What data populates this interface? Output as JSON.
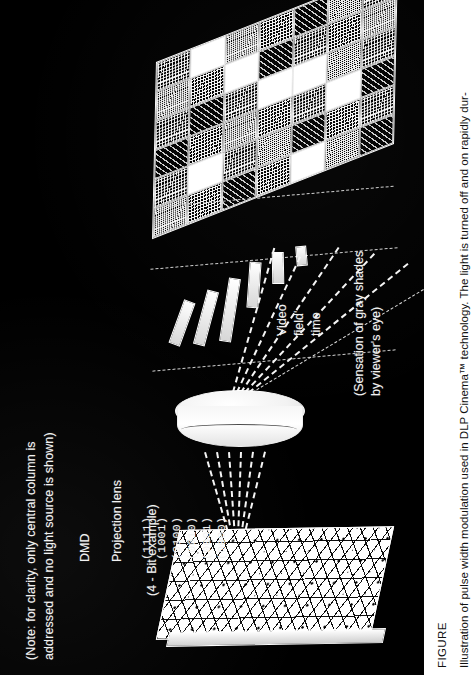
{
  "figure": {
    "background_color": "#000000",
    "text_color": "#f2f2f2",
    "note": {
      "line1": "(Note:  for clarity, only central column is",
      "line2": "addressed and no light source is shown)"
    },
    "labels": {
      "dmd": "DMD",
      "projection_lens": "Projection lens",
      "bit_example": "(4 - Bit example)",
      "video_field": "Video",
      "video_field2": "field'",
      "video_field3": "time",
      "sensation_line1": "(Sensation of gray shades",
      "sensation_line2": "by viewer's eye)"
    },
    "bit_codes": [
      "(1111)",
      "(1001)",
      "(0100)",
      "(0010)",
      "(0001)",
      "(0000)"
    ],
    "screen": {
      "columns": 7,
      "rows": 6,
      "cell_shades": [
        [
          "dith",
          "white",
          "dith2",
          "dith",
          "dith3",
          "dith2",
          "dith"
        ],
        [
          "dith2",
          "dith",
          "white",
          "dith3",
          "dith",
          "dith",
          "dith2"
        ],
        [
          "dith",
          "dith3",
          "dith",
          "white",
          "white",
          "dith2",
          "dith"
        ],
        [
          "dith3",
          "dith",
          "dith2",
          "dith",
          "dith",
          "white",
          "dith3"
        ],
        [
          "dith",
          "white",
          "dith",
          "dith2",
          "dith3",
          "dith",
          "dith"
        ],
        [
          "dith2",
          "dith",
          "dith3",
          "dith",
          "white",
          "dith2",
          "dith3"
        ]
      ]
    }
  },
  "caption": {
    "figure_word": "FIGURE",
    "text": "Illustration of pulse width modulation used in DLP Cinema™ technology. The light is turned off and on rapidly dur-"
  }
}
